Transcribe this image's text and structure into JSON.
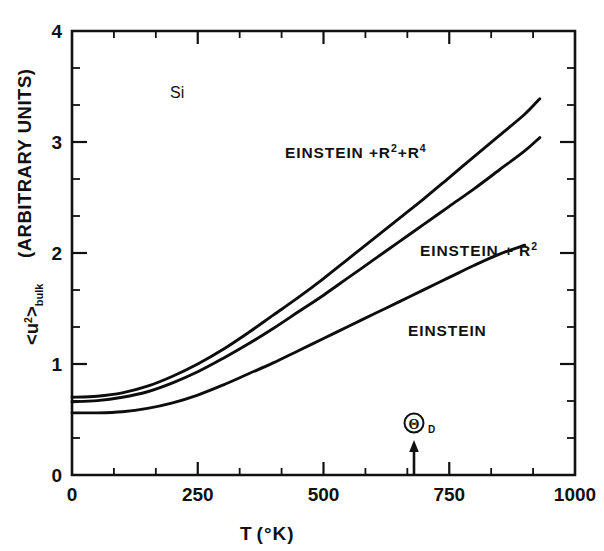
{
  "figure": {
    "material_label": "Si",
    "x_axis": {
      "title_main": "T",
      "title_units": "(°K)",
      "ticks": [
        "0",
        "250",
        "500",
        "750",
        "1000"
      ],
      "tick_values": [
        0,
        250,
        500,
        750,
        1000
      ],
      "range": [
        0,
        1000
      ],
      "minor_per_major": 2
    },
    "y_axis": {
      "title_symbol": "<u",
      "title_sup": "2",
      "title_mid": ">",
      "title_sub": "bulk",
      "title_units": "(ARBITRARY UNITS)",
      "ticks": [
        "0",
        "1",
        "2",
        "3",
        "4"
      ],
      "tick_values": [
        0,
        1,
        2,
        3,
        4
      ],
      "range": [
        0,
        4
      ],
      "minor_per_major": 2
    },
    "marker": {
      "symbol": "Θ",
      "subscript": "D",
      "name": "debye-temperature-marker",
      "x_value": 680
    },
    "curve_labels": [
      {
        "id": "einstein-r2-r4",
        "text_main": "EINSTEIN +R",
        "sup1": "2",
        "mid": "+R",
        "sup2": "4",
        "x": 285,
        "y": 152
      },
      {
        "id": "einstein-r2",
        "text_main": "EINSTEIN + R",
        "sup1": "2",
        "mid": "",
        "sup2": "",
        "x": 420,
        "y": 250
      },
      {
        "id": "einstein",
        "text_main": "EINSTEIN",
        "sup1": "",
        "mid": "",
        "sup2": "",
        "x": 408,
        "y": 330
      }
    ],
    "colors": {
      "ink": "#111111",
      "background": "#ffffff"
    }
  },
  "chart_data": {
    "type": "line",
    "title": "",
    "subtitle": "Si",
    "xlabel": "T (°K)",
    "ylabel": "<u²>bulk (ARBITRARY UNITS)",
    "xlim": [
      0,
      1000
    ],
    "ylim": [
      0,
      4
    ],
    "xticks": [
      0,
      250,
      500,
      750,
      1000
    ],
    "yticks": [
      0,
      1,
      2,
      3,
      4
    ],
    "grid": false,
    "legend": "inline-curve-labels",
    "annotations": [
      {
        "text": "Si",
        "x": 180,
        "y": 3.55
      },
      {
        "text": "Θ_D",
        "x": 680,
        "y": 0.3,
        "type": "arrow-marker"
      }
    ],
    "series": [
      {
        "name": "EINSTEIN +R²+R⁴",
        "x": [
          0,
          50,
          100,
          150,
          200,
          250,
          300,
          350,
          400,
          450,
          500,
          550,
          600,
          650,
          700,
          750,
          800,
          850,
          900,
          930
        ],
        "y": [
          0.7,
          0.71,
          0.74,
          0.8,
          0.89,
          1.0,
          1.13,
          1.28,
          1.44,
          1.6,
          1.77,
          1.95,
          2.13,
          2.31,
          2.49,
          2.68,
          2.87,
          3.06,
          3.25,
          3.39
        ]
      },
      {
        "name": "EINSTEIN + R²",
        "x": [
          0,
          50,
          100,
          150,
          200,
          250,
          300,
          350,
          400,
          450,
          500,
          550,
          600,
          650,
          700,
          750,
          800,
          850,
          900,
          930
        ],
        "y": [
          0.66,
          0.67,
          0.7,
          0.75,
          0.83,
          0.93,
          1.05,
          1.18,
          1.32,
          1.47,
          1.62,
          1.78,
          1.94,
          2.1,
          2.26,
          2.42,
          2.58,
          2.75,
          2.92,
          3.04
        ]
      },
      {
        "name": "EINSTEIN",
        "x": [
          0,
          50,
          100,
          150,
          200,
          250,
          300,
          350,
          400,
          450,
          500,
          550,
          600,
          650,
          700,
          750,
          800,
          850,
          900
        ],
        "y": [
          0.56,
          0.56,
          0.57,
          0.6,
          0.65,
          0.72,
          0.81,
          0.91,
          1.01,
          1.12,
          1.23,
          1.34,
          1.45,
          1.56,
          1.67,
          1.78,
          1.89,
          1.99,
          2.07
        ]
      }
    ]
  }
}
